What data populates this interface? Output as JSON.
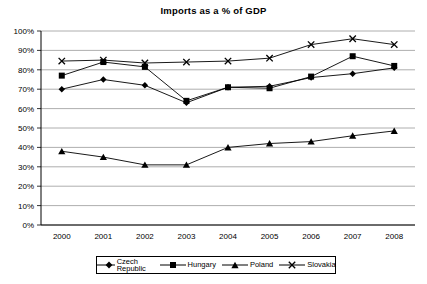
{
  "chart_data": {
    "type": "line",
    "title": "Imports as a % of GDP",
    "xlabel": "",
    "ylabel": "",
    "categories": [
      "2000",
      "2001",
      "2002",
      "2003",
      "2004",
      "2005",
      "2006",
      "2007",
      "2008"
    ],
    "x": [
      2000,
      2001,
      2002,
      2003,
      2004,
      2005,
      2006,
      2007,
      2008
    ],
    "ylim": [
      0,
      100
    ],
    "yticks": [
      "0%",
      "10%",
      "20%",
      "30%",
      "40%",
      "50%",
      "60%",
      "70%",
      "80%",
      "90%",
      "100%"
    ],
    "ytick_values": [
      0,
      10,
      20,
      30,
      40,
      50,
      60,
      70,
      80,
      90,
      100
    ],
    "grid": true,
    "legend_position": "bottom",
    "series": [
      {
        "name": "Czech Republic",
        "marker": "diamond",
        "color": "#000000",
        "values": [
          70,
          75,
          72,
          63,
          71,
          71.5,
          76,
          78,
          81
        ]
      },
      {
        "name": "Hungary",
        "marker": "square",
        "color": "#000000",
        "values": [
          77,
          84,
          81.5,
          64,
          71,
          70.5,
          76.5,
          87,
          82
        ]
      },
      {
        "name": "Poland",
        "marker": "triangle",
        "color": "#000000",
        "values": [
          38,
          35,
          31,
          31,
          40,
          42,
          43,
          46,
          48.5
        ]
      },
      {
        "name": "Slovakia",
        "marker": "cross",
        "color": "#000000",
        "values": [
          84.5,
          85,
          83.5,
          84,
          84.5,
          86,
          93,
          96,
          93
        ]
      }
    ]
  },
  "legend": {
    "items": [
      {
        "label": "Czech Republic",
        "marker": "diamond"
      },
      {
        "label": "Hungary",
        "marker": "square"
      },
      {
        "label": "Poland",
        "marker": "triangle"
      },
      {
        "label": "Slovakia",
        "marker": "cross"
      }
    ]
  }
}
